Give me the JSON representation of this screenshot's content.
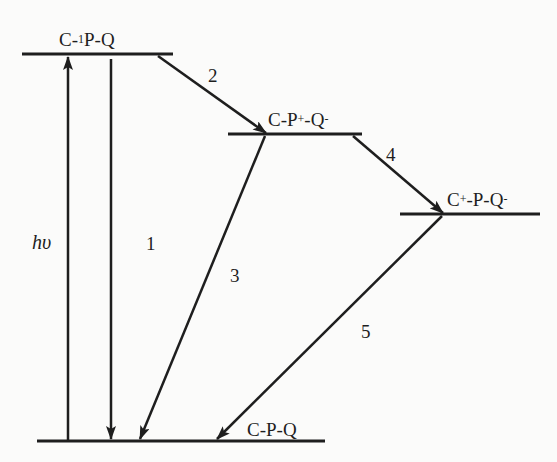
{
  "diagram": {
    "title": "",
    "type": "energy-level diagram",
    "colors": {
      "background": "#fbfbfa",
      "ink": "#1e1e1e"
    },
    "levels": [
      {
        "id": "excited",
        "label_prefix": "C-",
        "label_sup": "1",
        "label_suffix": "P-Q",
        "full_label": "C-1P-Q"
      },
      {
        "id": "cs1",
        "label_prefix": "C-P",
        "label_sup1": "+",
        "label_mid": "-Q",
        "label_sup2": "-",
        "full_label": "C-P+-Q-"
      },
      {
        "id": "cs2",
        "label_prefix": "C",
        "label_sup1": "+",
        "label_mid": "-P-Q",
        "label_sup2": "-",
        "full_label": "C+-P-Q-"
      },
      {
        "id": "ground",
        "full_label": "C-P-Q"
      }
    ],
    "transitions": [
      {
        "id": "hv",
        "label": "hυ",
        "from": "ground",
        "to": "excited",
        "direction": "up"
      },
      {
        "id": "1",
        "label": "1",
        "from": "excited",
        "to": "ground"
      },
      {
        "id": "2",
        "label": "2",
        "from": "excited",
        "to": "cs1"
      },
      {
        "id": "3",
        "label": "3",
        "from": "cs1",
        "to": "ground"
      },
      {
        "id": "4",
        "label": "4",
        "from": "cs1",
        "to": "cs2"
      },
      {
        "id": "5",
        "label": "5",
        "from": "cs2",
        "to": "ground"
      }
    ]
  }
}
